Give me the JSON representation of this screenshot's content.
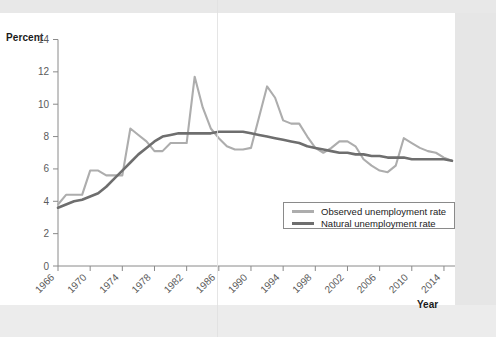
{
  "axis": {
    "y_title": "Percent",
    "x_title": "Year"
  },
  "legend": {
    "items": [
      {
        "label": "Observed unemployment rate",
        "color": "#adadad"
      },
      {
        "label": "Natural unemployment rate",
        "color": "#6e6e6e"
      }
    ]
  },
  "chart_data": {
    "type": "line",
    "title": "",
    "xlabel": "Year",
    "ylabel": "Percent",
    "xlim": [
      1966,
      2015
    ],
    "ylim": [
      0,
      14
    ],
    "ytick_labels": [
      "0",
      "2",
      "4",
      "6",
      "8",
      "10",
      "12",
      "14"
    ],
    "ytick_values": [
      0,
      2,
      4,
      6,
      8,
      10,
      12,
      14
    ],
    "xtick_labels": [
      "1966",
      "1970",
      "1974",
      "1978",
      "1982",
      "1986",
      "1990",
      "1994",
      "1998",
      "2002",
      "2006",
      "2010",
      "2014"
    ],
    "xtick_values": [
      1966,
      1970,
      1974,
      1978,
      1982,
      1986,
      1990,
      1994,
      1998,
      2002,
      2006,
      2010,
      2014
    ],
    "grid": false,
    "legend_position": "inside-lower-right",
    "x": [
      1966,
      1967,
      1968,
      1969,
      1970,
      1971,
      1972,
      1973,
      1974,
      1975,
      1976,
      1977,
      1978,
      1979,
      1980,
      1981,
      1982,
      1983,
      1984,
      1985,
      1986,
      1987,
      1988,
      1989,
      1990,
      1991,
      1992,
      1993,
      1994,
      1995,
      1996,
      1997,
      1998,
      1999,
      2000,
      2001,
      2002,
      2003,
      2004,
      2005,
      2006,
      2007,
      2008,
      2009,
      2010,
      2011,
      2012,
      2013,
      2014,
      2015
    ],
    "series": [
      {
        "name": "Observed unemployment rate",
        "color": "#adadad",
        "values": [
          3.8,
          4.4,
          4.4,
          4.4,
          5.9,
          5.9,
          5.6,
          5.6,
          5.6,
          8.5,
          8.1,
          7.7,
          7.1,
          7.1,
          7.6,
          7.6,
          7.6,
          11.7,
          9.8,
          8.5,
          7.9,
          7.4,
          7.2,
          7.2,
          7.3,
          9.2,
          11.1,
          10.4,
          9.0,
          8.8,
          8.8,
          8.0,
          7.3,
          7.0,
          7.3,
          7.7,
          7.7,
          7.4,
          6.6,
          6.2,
          5.9,
          5.8,
          6.2,
          7.9,
          7.6,
          7.3,
          7.1,
          7.0,
          6.7,
          6.5
        ]
      },
      {
        "name": "Natural unemployment rate",
        "color": "#6e6e6e",
        "values": [
          3.6,
          3.8,
          4.0,
          4.1,
          4.3,
          4.5,
          4.9,
          5.4,
          5.9,
          6.4,
          6.9,
          7.3,
          7.7,
          8.0,
          8.1,
          8.2,
          8.2,
          8.2,
          8.2,
          8.2,
          8.3,
          8.3,
          8.3,
          8.3,
          8.2,
          8.1,
          8.0,
          7.9,
          7.8,
          7.7,
          7.6,
          7.4,
          7.3,
          7.2,
          7.1,
          7.0,
          7.0,
          6.9,
          6.9,
          6.8,
          6.8,
          6.7,
          6.7,
          6.7,
          6.6,
          6.6,
          6.6,
          6.6,
          6.6,
          6.5
        ]
      }
    ]
  }
}
